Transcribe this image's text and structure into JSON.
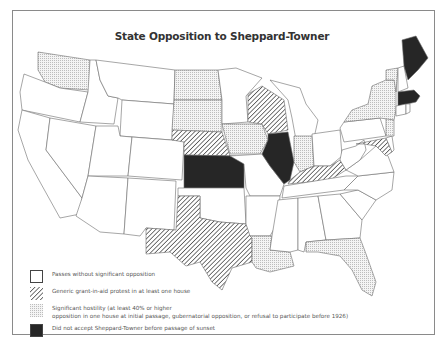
{
  "title": "State Opposition to Sheppard-Towner",
  "colors": {
    "border": "#8a8a8a",
    "state_stroke": "#6b6b6b",
    "pass_fill": "#ffffff",
    "protest_hatch": "#4a4a4a",
    "hostility_dot": "#c4c4c4",
    "rejected_fill": "#262626"
  },
  "legend": {
    "items": [
      {
        "key": "pass",
        "label": "Passes without significant opposition"
      },
      {
        "key": "protest",
        "label": "Generic grant-in-aid protest in at least one house"
      },
      {
        "key": "hostility",
        "label_line1": "Significant hostility (at least 40% or higher",
        "label_line2": "opposition in one house at initial passage, gubernatorial opposition, or refusal to participate before 1926)"
      },
      {
        "key": "rejected",
        "label": "Did not accept Sheppard-Towner before passage of sunset"
      }
    ]
  },
  "states": {
    "rejected": [
      "Maine",
      "Massachusetts",
      "Illinois",
      "Kansas"
    ],
    "protest": [
      "Wisconsin",
      "Nebraska",
      "Texas",
      "Kentucky",
      "Maryland"
    ],
    "hostility": [
      "Washington",
      "North Dakota",
      "South Dakota",
      "Iowa",
      "Indiana",
      "New York",
      "Vermont",
      "New Jersey",
      "Louisiana",
      "Florida"
    ],
    "pass": [
      "Oregon",
      "California",
      "Idaho",
      "Nevada",
      "Montana",
      "Wyoming",
      "Utah",
      "Arizona",
      "Colorado",
      "New Mexico",
      "Minnesota",
      "Oklahoma",
      "Missouri",
      "Arkansas",
      "Mississippi",
      "Alabama",
      "Georgia",
      "Tennessee",
      "Michigan",
      "Ohio",
      "West Virginia",
      "Virginia",
      "North Carolina",
      "South Carolina",
      "Pennsylvania",
      "New Hampshire",
      "Connecticut",
      "Rhode Island",
      "Delaware"
    ]
  }
}
